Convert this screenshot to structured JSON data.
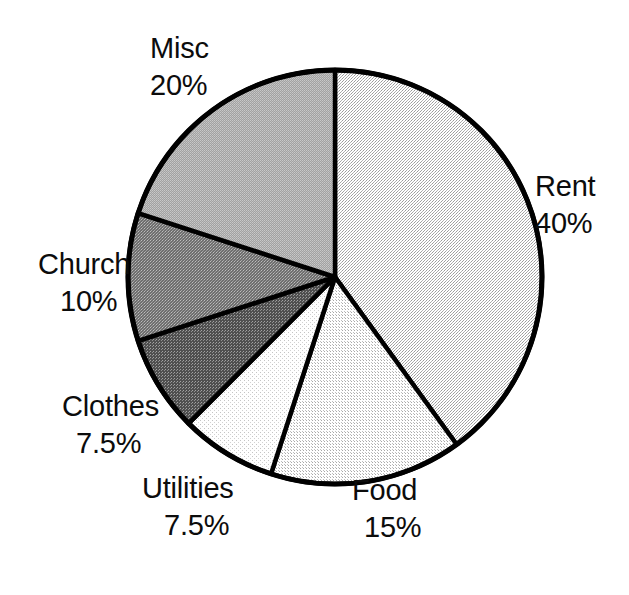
{
  "chart_data": {
    "type": "pie",
    "title": "",
    "subtitle": "",
    "xlabel": "",
    "ylabel": "",
    "legend_position": "none",
    "grid": false,
    "start_angle_deg": 0,
    "direction": "clockwise",
    "categories": [
      "Rent",
      "Food",
      "Utilities",
      "Clothes",
      "Church",
      "Misc"
    ],
    "values": [
      40,
      15,
      7.5,
      7.5,
      10,
      20
    ],
    "value_unit": "%",
    "slices": [
      {
        "name": "Rent",
        "label": "Rent",
        "value": 40,
        "pct_text": "40%",
        "fill": "#e9e9e9",
        "pattern": "fine-dot-light",
        "label_position": "right"
      },
      {
        "name": "Food",
        "label": "Food",
        "value": 15,
        "pct_text": "15%",
        "fill": "#efefef",
        "pattern": "fine-dot-light",
        "label_position": "bottom"
      },
      {
        "name": "Utilities",
        "label": "Utilities",
        "value": 7.5,
        "pct_text": "7.5%",
        "fill": "#fbfbfb",
        "pattern": "sparse-dot",
        "label_position": "bottom-left"
      },
      {
        "name": "Clothes",
        "label": "Clothes",
        "value": 7.5,
        "pct_text": "7.5%",
        "fill": "#6d6d6d",
        "pattern": "dark-dot",
        "label_position": "left-lower"
      },
      {
        "name": "Church",
        "label": "Church",
        "value": 10,
        "pct_text": "10%",
        "fill": "#8c8c8c",
        "pattern": "mid-dot",
        "label_position": "left"
      },
      {
        "name": "Misc",
        "label": "Misc",
        "value": 20,
        "pct_text": "20%",
        "fill": "#b4b4b4",
        "pattern": "mid-light-dot",
        "label_position": "top-left"
      }
    ],
    "stroke_color": "#000000",
    "background": "#ffffff"
  },
  "labels": {
    "misc": {
      "name": "Misc",
      "pct": "20%"
    },
    "rent": {
      "name": "Rent",
      "pct": "40%"
    },
    "food": {
      "name": "Food",
      "pct": "15%"
    },
    "utilities": {
      "name": "Utilities",
      "pct": "7.5%"
    },
    "clothes": {
      "name": "Clothes",
      "pct": "7.5%"
    },
    "church": {
      "name": "Church",
      "pct": "10%"
    }
  }
}
